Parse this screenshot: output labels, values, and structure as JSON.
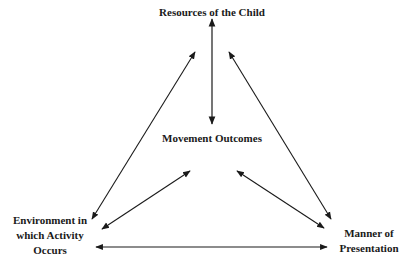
{
  "diagram": {
    "type": "triangle-relationship",
    "nodes": {
      "top": {
        "label": "Resources of the Child"
      },
      "center": {
        "label": "Movement Outcomes"
      },
      "bottom_left": {
        "line1": "Environment in",
        "line2": "which Activity",
        "line3": "Occurs"
      },
      "bottom_right": {
        "line1": "Manner of",
        "line2": "Presentation"
      }
    },
    "edges": [
      {
        "from": "top",
        "to": "center",
        "bidirectional": true
      },
      {
        "from": "top",
        "to": "bottom_left",
        "bidirectional": true
      },
      {
        "from": "top",
        "to": "bottom_right",
        "bidirectional": true
      },
      {
        "from": "center",
        "to": "bottom_left",
        "bidirectional": true
      },
      {
        "from": "center",
        "to": "bottom_right",
        "bidirectional": true
      },
      {
        "from": "bottom_left",
        "to": "bottom_right",
        "bidirectional": true
      }
    ],
    "colors": {
      "line": "#1a1a1a",
      "background": "#ffffff"
    }
  }
}
